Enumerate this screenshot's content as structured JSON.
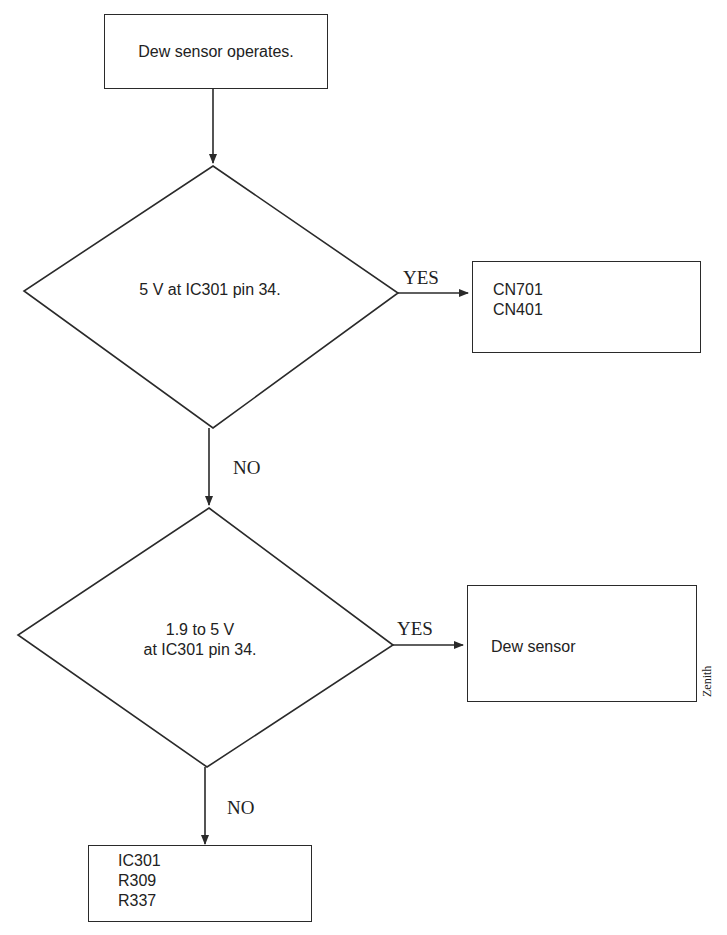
{
  "diagram": {
    "type": "flowchart",
    "start": {
      "text": "Dew sensor operates."
    },
    "decision1": {
      "text": "5 V at IC301 pin 34.",
      "yes_label": "YES",
      "no_label": "NO"
    },
    "result1": {
      "lines": [
        "CN701",
        "CN401"
      ]
    },
    "decision2": {
      "line1": "1.9 to 5 V",
      "line2": "at IC301 pin 34.",
      "yes_label": "YES",
      "no_label": "NO"
    },
    "result2": {
      "text": "Dew sensor"
    },
    "result3": {
      "lines": [
        "IC301",
        "R309",
        "R337"
      ]
    },
    "side_label": "Zenith",
    "colors": {
      "line": "#2a2a2a",
      "text": "#222222",
      "background": "#ffffff"
    }
  }
}
